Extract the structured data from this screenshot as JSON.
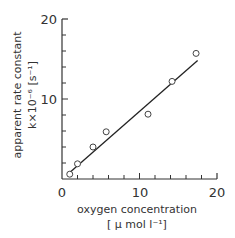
{
  "chart_data": {
    "type": "scatter",
    "title": "",
    "xlabel": "oxygen concentration",
    "xlabel_unit": "[ μ mol l⁻¹]",
    "ylabel": "apparent rate constant",
    "ylabel_unit": "k×10⁻⁶ [s⁻¹]",
    "xlim": [
      0,
      20
    ],
    "ylim": [
      0,
      20
    ],
    "x_ticks_labeled": [
      0,
      10,
      20
    ],
    "y_ticks_labeled": [
      10,
      20
    ],
    "grid": false,
    "legend": null,
    "series": [
      {
        "name": "measured",
        "marker": "open-circle",
        "points": [
          {
            "x": 1.0,
            "y": 0.6
          },
          {
            "x": 2.0,
            "y": 1.9
          },
          {
            "x": 4.0,
            "y": 4.0
          },
          {
            "x": 5.7,
            "y": 5.9
          },
          {
            "x": 11.1,
            "y": 8.1
          },
          {
            "x": 14.2,
            "y": 12.2
          },
          {
            "x": 17.3,
            "y": 15.7
          }
        ]
      },
      {
        "name": "linear fit",
        "marker": "line",
        "points": [
          {
            "x": 1.0,
            "y": 0.8
          },
          {
            "x": 17.5,
            "y": 14.8
          }
        ]
      }
    ]
  },
  "labels": {
    "x0": "0",
    "x10": "10",
    "x20": "20",
    "y10": "10",
    "y20": "20",
    "xlabel": "oxygen concentration",
    "xunit": "[ μ mol l⁻¹]",
    "ylabel": "apparent rate constant",
    "yunit": "k×10⁻⁶ [s⁻¹]"
  }
}
